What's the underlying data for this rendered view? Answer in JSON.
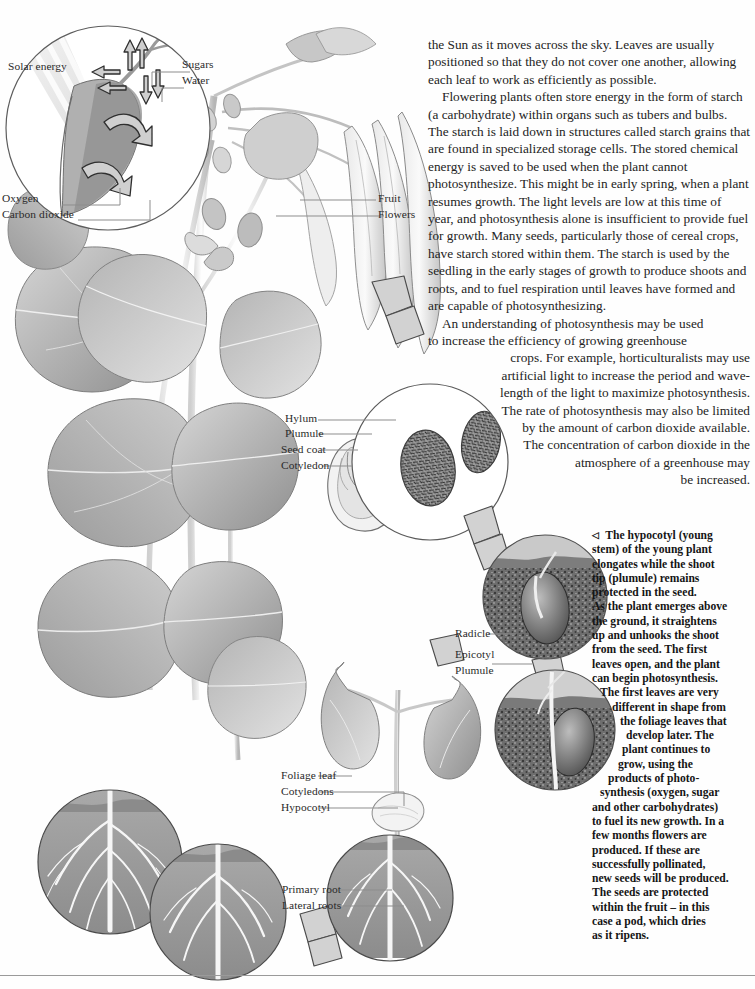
{
  "body_text": {
    "paragraphs": [
      {
        "indent": false,
        "width": "full",
        "lines": [
          "the Sun as it moves across the sky. Leaves are usually",
          "positioned so that they do not cover one another,",
          "allowing each leaf to work as efficiently as possible."
        ]
      },
      {
        "indent": true,
        "width": "full",
        "lines": [
          "Flowering plants often store energy in the form of",
          "starch (a carbohydrate) within organs such as tubers",
          "and bulbs. The starch is laid down in structures called",
          "starch grains that are found in specialized storage cells.",
          "The stored chemical energy is saved to be used when",
          "the plant cannot photosynthesize. This might be in",
          "early spring, when a plant resumes growth. The light",
          "levels are low at this time of year, and photosynthesis",
          "alone is insufficient to provide fuel for growth. Many",
          "seeds, particularly those of cereal crops, have starch",
          "stored within them. The starch is used by the seedling",
          "in the early stages of growth to produce shoots and",
          "roots, and to fuel respiration until leaves have formed",
          "and are capable of photosynthesizing."
        ]
      },
      {
        "indent": true,
        "width": "tapered",
        "lines": [
          "An understanding of photosynthesis may be used",
          "to increase the efficiency of growing greenhouse",
          "crops. For example, horticulturalists may use",
          "artificial light to increase the period and wave-",
          "length of the light to maximize photosynthesis.",
          "The rate of photosynthesis may also be limited",
          "by the amount of carbon dioxide available.",
          "The concentration of carbon dioxide in the",
          "atmosphere of a greenhouse may",
          "be increased."
        ]
      }
    ]
  },
  "caption": {
    "marker": "◁",
    "lines": [
      "The hypocotyl (young",
      "stem) of the young plant",
      "elongates while the shoot",
      "tip (plumule) remains",
      "protected in the seed.",
      "As the plant emerges above",
      "the ground, it straightens",
      "up and unhooks the shoot",
      "from the seed. The first",
      "leaves open, and the plant",
      "can begin photosynthesis.",
      "The first leaves are very",
      "different in shape from",
      "the foliage leaves that",
      "develop later. The",
      "plant continues to",
      "grow, using the",
      "products of photo-",
      "synthesis (oxygen, sugar",
      "and other carbohydrates)",
      "to fuel its new growth. In a",
      "few months flowers are",
      "produced. If these are",
      "successfully pollinated,",
      "new seeds will be produced.",
      "The seeds are protected",
      "within the fruit – in this",
      "case a pod, which dries",
      "as it ripens."
    ]
  },
  "labels": {
    "solar_energy": "Solar energy",
    "sugars": "Sugars",
    "water": "Water",
    "oxygen": "Oxygen",
    "carbon_dioxide": "Carbon dioxide",
    "fruit": "Fruit",
    "flowers": "Flowers",
    "hylum": "Hylum",
    "plumule_seed": "Plumule",
    "seed_coat": "Seed coat",
    "cotyledon": "Cotyledon",
    "radicle": "Radicle",
    "epicotyl": "Epicotyl",
    "plumule_seedling": "Plumule",
    "foliage_leaf": "Foliage leaf",
    "cotyledons": "Cotyledons",
    "hypocotyl": "Hypocotyl",
    "primary_root": "Primary root",
    "lateral_roots": "Lateral roots"
  },
  "colors": {
    "ink": "#232323",
    "leader": "#8d8d8d",
    "leaf_dark": "#8e8e8e",
    "leaf_light": "#c9c9c9",
    "soil": "#6f6f6f",
    "seed_speckle": "#3a3a3a",
    "arrow_fill": "#cfcfcf",
    "rule": "#9a9a9a"
  }
}
